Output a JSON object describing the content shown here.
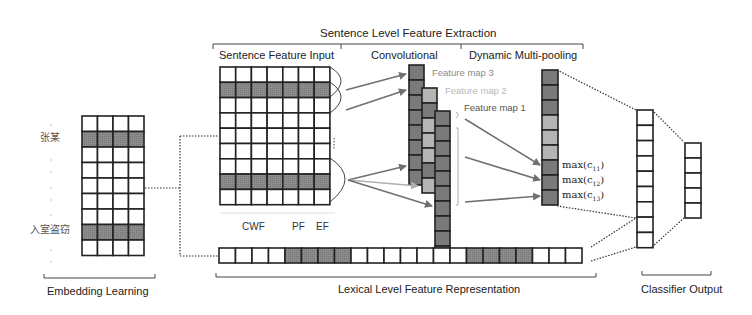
{
  "title": "Sentence Level Feature Extraction",
  "sections": {
    "sentence_feature_input": "Sentence Feature Input",
    "convolutional": "Convolutional",
    "dynamic_multi_pooling": "Dynamic Multi-pooling",
    "embedding_learning": "Embedding Learning",
    "lexical_level": "Lexical Level Feature Representation",
    "classifier_output": "Classifier Output"
  },
  "feature_maps": [
    "Feature map 3",
    "Feature map 2",
    "Feature map 1"
  ],
  "input_columns": {
    "cwf": "CWF",
    "pf": "PF",
    "ef": "EF"
  },
  "words": {
    "word1": "张某",
    "word2": "入室盗窃"
  },
  "pooling_labels": [
    "max(c11)",
    "max(c12)",
    "max(c13)"
  ],
  "colors": {
    "line": "#222222",
    "dark_cell": "#7a7a7a",
    "light_cell": "#b4b4b4",
    "highlight_row": "#8c8c8c",
    "arrow": "#707070",
    "arrow_light": "#b0b0b0"
  },
  "structure": {
    "embedding_matrix": {
      "rows": 9,
      "cols": 4,
      "highlighted_rows": [
        1,
        7
      ]
    },
    "sentence_matrix": {
      "rows": 9,
      "cols": 7,
      "highlighted_rows": [
        1,
        7
      ]
    },
    "lexical_vector": {
      "cells": 22,
      "highlighted": [
        4,
        5,
        6,
        7,
        15,
        16,
        17,
        18
      ]
    },
    "pooling_vector": {
      "cells": 9,
      "shades": [
        "d",
        "d",
        "d",
        "l",
        "l",
        "l",
        "d",
        "d",
        "d"
      ]
    },
    "hidden_vector": {
      "cells": 9
    },
    "output_vector": {
      "cells": 5
    }
  }
}
